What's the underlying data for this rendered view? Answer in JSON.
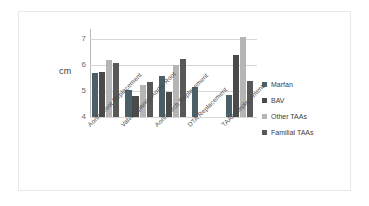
{
  "chart_data": {
    "type": "bar",
    "title": "",
    "subtitle": "",
    "xlabel": "",
    "ylabel": "cm",
    "ylim": [
      4,
      7.4
    ],
    "yticks": [
      4,
      5,
      6,
      7
    ],
    "ytick_labels": [
      "4",
      "5",
      "6",
      "7"
    ],
    "grid": true,
    "legend_position": "right",
    "categories": [
      "Aortic Root Replacement",
      "Valve Sparing Aortic Root",
      "Aortic Arch Replacement",
      "DTA Replacement",
      "TAAA Replacement"
    ],
    "series": [
      {
        "name": "Marfan",
        "color": "#4b5f66",
        "values": [
          5.7,
          5.05,
          5.6,
          5.15,
          4.85
        ]
      },
      {
        "name": "BAV",
        "color": "#4a4a4a",
        "values": [
          5.75,
          4.8,
          4.95,
          null,
          6.4
        ]
      },
      {
        "name": "Other TAAs",
        "color": "#b5b5b5",
        "values": [
          6.2,
          5.25,
          6.0,
          null,
          7.1
        ]
      },
      {
        "name": "Familial TAAs",
        "color": "#585858",
        "values": [
          6.1,
          5.35,
          6.25,
          null,
          5.4
        ]
      }
    ]
  },
  "legend": {
    "items": [
      {
        "label": "Marfan",
        "color": "#4b5f66"
      },
      {
        "label": "BAV",
        "color": "#4a4a4a"
      },
      {
        "label": "Other TAAs",
        "color": "#b5b5b5"
      },
      {
        "label": "Familial TAAs",
        "color": "#585858"
      }
    ]
  },
  "axis": {
    "y_label": "cm",
    "y_ticks": [
      "7",
      "6",
      "5",
      "4"
    ]
  }
}
